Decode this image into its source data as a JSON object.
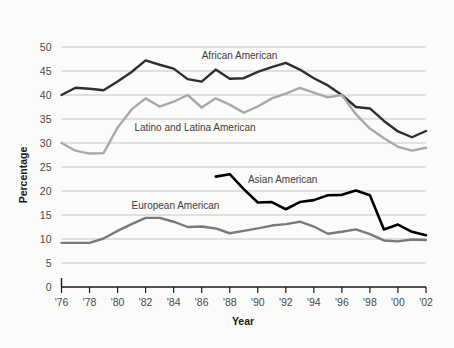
{
  "chart_data": {
    "type": "line",
    "title": "",
    "xlabel": "Year",
    "ylabel": "Percentage",
    "ylim": [
      0,
      50
    ],
    "ytick_step": 5,
    "yticks": [
      "0",
      "5",
      "10",
      "15",
      "20",
      "25",
      "30",
      "35",
      "40",
      "45",
      "50"
    ],
    "xlim": [
      1976,
      2002
    ],
    "xticks": [
      "'76",
      "'78",
      "'80",
      "'82",
      "'84",
      "'86",
      "'88",
      "'90",
      "'92",
      "'94",
      "'96",
      "'98",
      "'00",
      "'02"
    ],
    "xtick_years": [
      1976,
      1978,
      1980,
      1982,
      1984,
      1986,
      1988,
      1990,
      1992,
      1994,
      1996,
      1998,
      2000,
      2002
    ],
    "grid": "horizontal",
    "legend": "inline-labels",
    "x": [
      1976,
      1977,
      1978,
      1979,
      1980,
      1981,
      1982,
      1983,
      1984,
      1985,
      1986,
      1987,
      1988,
      1989,
      1990,
      1991,
      1992,
      1993,
      1994,
      1995,
      1996,
      1997,
      1998,
      1999,
      2000,
      2001,
      2002
    ],
    "series": [
      {
        "name": "African American",
        "color": "#2e2e2e",
        "width": 2.4,
        "label_x": 1986.0,
        "label_y": 47.6,
        "x": [
          1976,
          1977,
          1978,
          1979,
          1980,
          1981,
          1982,
          1983,
          1984,
          1985,
          1986,
          1987,
          1988,
          1989,
          1990,
          1991,
          1992,
          1993,
          1994,
          1995,
          1996,
          1997,
          1998,
          1999,
          2000,
          2001,
          2002
        ],
        "values": [
          40.0,
          41.5,
          41.3,
          41.0,
          42.8,
          44.8,
          47.2,
          46.3,
          45.5,
          43.3,
          42.8,
          45.3,
          43.4,
          43.5,
          44.8,
          45.8,
          46.7,
          45.3,
          43.5,
          42.0,
          40.0,
          37.5,
          37.2,
          34.6,
          32.4,
          31.2,
          32.5
        ]
      },
      {
        "name": "Latino and Latina American",
        "color": "#a8a8a8",
        "width": 2.4,
        "label_x": 1981.2,
        "label_y": 32.4,
        "x": [
          1976,
          1977,
          1978,
          1979,
          1980,
          1981,
          1982,
          1983,
          1984,
          1985,
          1986,
          1987,
          1988,
          1989,
          1990,
          1991,
          1992,
          1993,
          1994,
          1995,
          1996,
          1997,
          1998,
          1999,
          2000,
          2001,
          2002
        ],
        "values": [
          30.0,
          28.4,
          27.8,
          27.9,
          33.2,
          37.0,
          39.3,
          37.6,
          38.6,
          40.0,
          37.4,
          39.3,
          38.0,
          36.3,
          37.6,
          39.3,
          40.3,
          41.5,
          40.5,
          39.5,
          40.0,
          36.0,
          33.0,
          31.0,
          29.2,
          28.4,
          29.0
        ]
      },
      {
        "name": "Asian American",
        "color": "#000000",
        "width": 2.6,
        "label_x": 1989.3,
        "label_y": 21.6,
        "x": [
          1987,
          1988,
          1989,
          1990,
          1991,
          1992,
          1993,
          1994,
          1995,
          1996,
          1997,
          1998,
          1999,
          2000,
          2001,
          2002
        ],
        "values": [
          23.0,
          23.5,
          20.4,
          17.6,
          17.7,
          16.2,
          17.7,
          18.1,
          19.1,
          19.2,
          20.1,
          19.1,
          12.0,
          13.0,
          11.5,
          10.8
        ]
      },
      {
        "name": "European American",
        "color": "#7a7a7a",
        "width": 2.4,
        "label_x": 1981.0,
        "label_y": 16.3,
        "x": [
          1976,
          1977,
          1978,
          1979,
          1980,
          1981,
          1982,
          1983,
          1984,
          1985,
          1986,
          1987,
          1988,
          1989,
          1990,
          1991,
          1992,
          1993,
          1994,
          1995,
          1996,
          1997,
          1998,
          1999,
          2000,
          2001,
          2002
        ],
        "values": [
          9.2,
          9.2,
          9.2,
          10.1,
          11.7,
          13.1,
          14.4,
          14.4,
          13.6,
          12.5,
          12.6,
          12.2,
          11.2,
          11.7,
          12.2,
          12.8,
          13.1,
          13.6,
          12.6,
          11.1,
          11.5,
          12.0,
          11.0,
          9.7,
          9.5,
          9.9,
          9.8
        ]
      }
    ]
  }
}
